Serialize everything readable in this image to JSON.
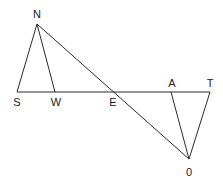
{
  "diagram": {
    "type": "geometry",
    "points": {
      "N": {
        "label": "N",
        "x": 37,
        "y": 24,
        "lx": 37,
        "ly": 18
      },
      "S": {
        "label": "S",
        "x": 17,
        "y": 92,
        "lx": 17,
        "ly": 106
      },
      "W": {
        "label": "W",
        "x": 55,
        "y": 92,
        "lx": 56,
        "ly": 106
      },
      "E": {
        "label": "E",
        "x": 113,
        "y": 92,
        "lx": 113,
        "ly": 106
      },
      "A": {
        "label": "A",
        "x": 171,
        "y": 92,
        "lx": 172,
        "ly": 87
      },
      "T": {
        "label": "T",
        "x": 210,
        "y": 92,
        "lx": 210,
        "ly": 87
      },
      "O": {
        "label": "0",
        "x": 189,
        "y": 159,
        "lx": 189,
        "ly": 176
      }
    },
    "segments": [
      [
        "N",
        "S"
      ],
      [
        "N",
        "W"
      ],
      [
        "N",
        "O"
      ],
      [
        "S",
        "T"
      ],
      [
        "A",
        "O"
      ],
      [
        "T",
        "O"
      ]
    ],
    "line_color": "#2a2a2a",
    "label_color": "#222222"
  }
}
